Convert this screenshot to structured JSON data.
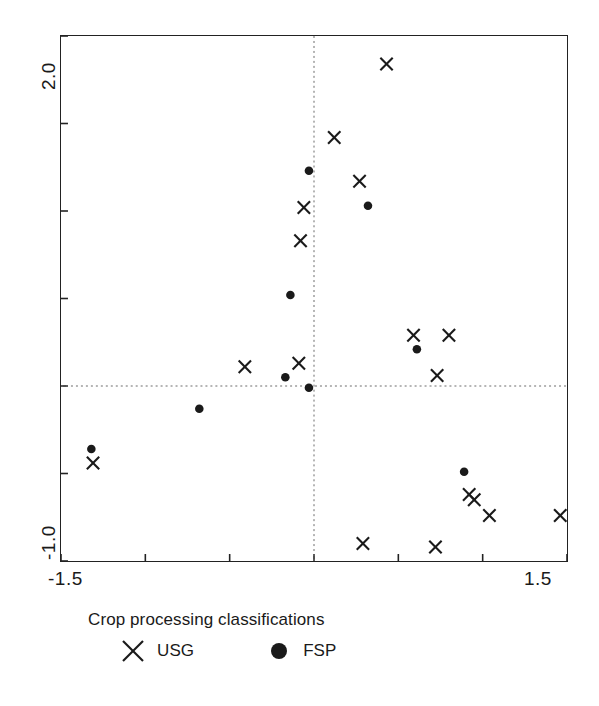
{
  "chart_data": {
    "type": "scatter",
    "title": "",
    "xlabel": "",
    "ylabel": "",
    "xlim": [
      -1.5,
      1.5
    ],
    "ylim": [
      -1.0,
      2.0
    ],
    "grid": false,
    "reference_lines": {
      "x": 0.0,
      "y": 0.0,
      "style": "dotted"
    },
    "xticks": [
      -1.5,
      -1.0,
      -0.5,
      0.0,
      0.5,
      1.0,
      1.5
    ],
    "xticklabels": [
      "-1.5",
      "",
      "",
      "",
      "",
      "",
      "1.5"
    ],
    "yticks": [
      -1.0,
      -0.5,
      0.0,
      0.5,
      1.0,
      1.5,
      2.0
    ],
    "yticklabels": [
      "-1.0",
      "",
      "",
      "",
      "",
      "",
      "2.0"
    ],
    "axis_label_left_bottom": "-1.5",
    "axis_label_left_top": "1.5",
    "legend": {
      "title": "Crop processing classifications",
      "position": "below",
      "entries": [
        {
          "name": "USG",
          "marker": "x"
        },
        {
          "name": "FSP",
          "marker": "circle"
        }
      ]
    },
    "series": [
      {
        "name": "USG",
        "marker": "x",
        "color": "#1a1a1a",
        "points": [
          {
            "x": 0.43,
            "y": 1.84
          },
          {
            "x": 0.12,
            "y": 1.42
          },
          {
            "x": 0.27,
            "y": 1.17
          },
          {
            "x": -0.06,
            "y": 1.02
          },
          {
            "x": -0.08,
            "y": 0.83
          },
          {
            "x": 0.59,
            "y": 0.29
          },
          {
            "x": 0.8,
            "y": 0.29
          },
          {
            "x": -0.41,
            "y": 0.11
          },
          {
            "x": -0.09,
            "y": 0.13
          },
          {
            "x": 0.73,
            "y": 0.06
          },
          {
            "x": -1.31,
            "y": -0.44
          },
          {
            "x": 0.92,
            "y": -0.62
          },
          {
            "x": 0.95,
            "y": -0.65
          },
          {
            "x": 1.04,
            "y": -0.74
          },
          {
            "x": 1.46,
            "y": -0.74
          },
          {
            "x": 0.29,
            "y": -0.9
          },
          {
            "x": 0.72,
            "y": -0.92
          }
        ]
      },
      {
        "name": "FSP",
        "marker": "circle",
        "color": "#1a1a1a",
        "points": [
          {
            "x": -0.03,
            "y": 1.23
          },
          {
            "x": 0.32,
            "y": 1.03
          },
          {
            "x": -0.14,
            "y": 0.52
          },
          {
            "x": 0.61,
            "y": 0.21
          },
          {
            "x": -0.17,
            "y": 0.05
          },
          {
            "x": -0.03,
            "y": -0.01
          },
          {
            "x": -0.68,
            "y": -0.13
          },
          {
            "x": -1.32,
            "y": -0.36
          },
          {
            "x": 0.89,
            "y": -0.49
          }
        ]
      }
    ]
  },
  "axes": {
    "y_top_label": "2.0",
    "y_bottom_label": "-1.0",
    "x_left_label": "-1.5",
    "x_right_label": "1.5"
  },
  "legend": {
    "title": "Crop processing classifications",
    "usg_label": "USG",
    "fsp_label": "FSP"
  },
  "style": {
    "marker_color": "#1a1a1a",
    "frame_color": "#222222",
    "reference_line_color": "#6a6a6a"
  }
}
